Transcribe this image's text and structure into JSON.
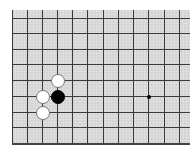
{
  "board": {
    "background_color": "#d4d4d4",
    "line_color": "#3a3a3a",
    "columns_x": [
      0,
      15,
      30,
      45,
      60,
      75,
      91,
      106,
      121,
      136,
      152,
      167
    ],
    "rows_y": [
      8,
      23,
      39,
      54,
      70,
      86,
      102,
      117,
      133
    ],
    "stones": [
      {
        "color": "white",
        "col": 3,
        "row": 4
      },
      {
        "color": "black",
        "col": 3,
        "row": 5
      },
      {
        "color": "white",
        "col": 2,
        "row": 5
      },
      {
        "color": "white",
        "col": 2,
        "row": 6
      }
    ],
    "star_points": [
      {
        "col": 9,
        "row": 5
      }
    ]
  }
}
